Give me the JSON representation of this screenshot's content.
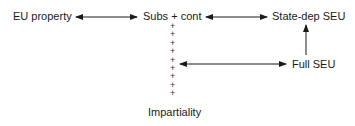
{
  "diagram": {
    "nodes": {
      "eu_property": "EU property",
      "subs_cont_left": "Subs",
      "subs_cont_plus": "+",
      "subs_cont_right": "cont",
      "state_dep_seu": "State-dep SEU",
      "full_seu": "Full SEU",
      "impartiality": "Impartiality"
    },
    "connector_glyph": "+",
    "connector_count": 9,
    "edges": [
      {
        "from": "EU property",
        "to": "Subs + cont",
        "type": "bidirectional"
      },
      {
        "from": "Subs + cont",
        "to": "State-dep SEU",
        "type": "bidirectional"
      },
      {
        "from": "Full SEU",
        "to": "State-dep SEU",
        "type": "directed"
      },
      {
        "from": "Subs + cont / Impartiality axis",
        "to": "Full SEU",
        "type": "bidirectional"
      }
    ]
  }
}
